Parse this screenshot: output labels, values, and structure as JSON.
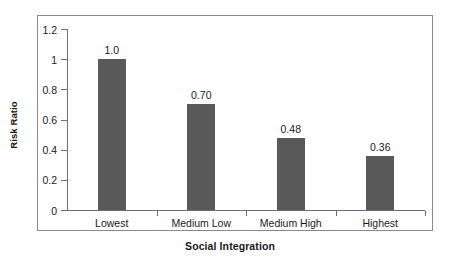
{
  "chart_data": {
    "type": "bar",
    "title": "",
    "xlabel": "Social Integration",
    "ylabel": "Risk Ratio",
    "categories": [
      "Lowest",
      "Medium Low",
      "Medium High",
      "Highest"
    ],
    "values": [
      1.0,
      0.7,
      0.48,
      0.36
    ],
    "value_labels": [
      "1.0",
      "0.70",
      "0.48",
      "0.36"
    ],
    "ylim": [
      0,
      1.2
    ],
    "ytick_values": [
      0,
      0.2,
      0.4,
      0.6,
      0.8,
      1,
      1.2
    ],
    "ytick_labels": [
      "0",
      "0.2",
      "0.4",
      "0.6",
      "0.8",
      "1",
      "1.2"
    ],
    "grid": false,
    "legend": null,
    "bar_color": "#595959",
    "axis_color": "#6f6f6f",
    "frame_color": "#8a8a8a",
    "background": "#ffffff"
  }
}
